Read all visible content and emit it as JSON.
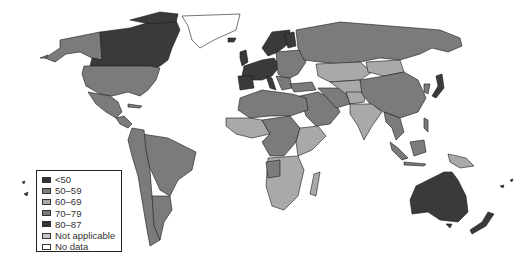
{
  "map": {
    "type": "world-choropleth",
    "colors": {
      "dark": "#3a3a3a",
      "mid": "#7b7b7b",
      "light": "#a9a9a9",
      "none": "#ffffff"
    }
  },
  "legend": {
    "items": [
      {
        "label": "<50",
        "color": "#333333"
      },
      {
        "label": "50–59",
        "color": "#7b7b7b"
      },
      {
        "label": "60–69",
        "color": "#a9a9a9"
      },
      {
        "label": "70–79",
        "color": "#7b7b7b"
      },
      {
        "label": "80–87",
        "color": "#333333"
      },
      {
        "label": "Not applicable",
        "color": "#c4c4c4"
      },
      {
        "label": "No data",
        "color": "#ffffff"
      }
    ]
  }
}
